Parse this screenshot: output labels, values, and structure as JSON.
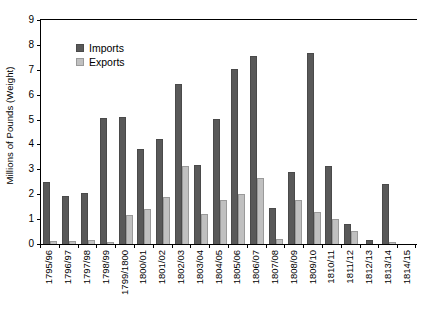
{
  "chart_data": {
    "type": "bar",
    "title": "",
    "xlabel": "",
    "ylabel": "Millions of Pounds (Weight)",
    "ylim": [
      0,
      9
    ],
    "ytick_step": 1,
    "yticks": [
      "0",
      "1",
      "2",
      "3",
      "4",
      "5",
      "6",
      "7",
      "8",
      "9"
    ],
    "grid": false,
    "legend_position": "upper-left-inside",
    "categories": [
      "1795/96",
      "1796/97",
      "1797/98",
      "1798/99",
      "1799/1800",
      "1800/01",
      "1801/02",
      "1802/03",
      "1803/04",
      "1804/05",
      "1805/06",
      "1806/07",
      "1807/08",
      "1808/09",
      "1809/10",
      "1810/11",
      "1811/12",
      "1812/13",
      "1813/14",
      "1814/15"
    ],
    "series": [
      {
        "name": "Imports",
        "color": "#595959",
        "values": [
          2.5,
          1.92,
          2.05,
          5.05,
          5.1,
          3.82,
          4.2,
          6.42,
          3.17,
          5.02,
          7.02,
          7.55,
          1.45,
          2.88,
          7.68,
          3.12,
          0.82,
          0.18,
          2.4,
          0.0
        ]
      },
      {
        "name": "Exports",
        "color": "#c0c0c0",
        "values": [
          0.12,
          0.11,
          0.15,
          0.08,
          1.17,
          1.4,
          1.87,
          3.13,
          1.2,
          1.78,
          2.0,
          2.65,
          0.2,
          1.78,
          1.3,
          1.0,
          0.52,
          0.0,
          0.08,
          0.0
        ]
      }
    ]
  },
  "legend": {
    "items": [
      {
        "label": "Imports"
      },
      {
        "label": "Exports"
      }
    ]
  },
  "colors": {
    "imports": "#595959",
    "exports": "#c0c0c0",
    "axis": "#000000",
    "background": "#ffffff"
  }
}
